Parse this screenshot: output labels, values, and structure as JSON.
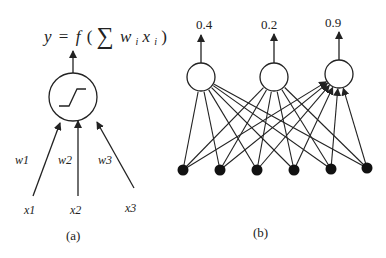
{
  "panel_a": {
    "formula": {
      "y": "y",
      "eq": "=",
      "f": "f",
      "open": "(",
      "sum": "∑",
      "w": "w",
      "wi_sub": "i",
      "x": "x",
      "xi_sub": "i",
      "close": ")"
    },
    "neuron": {
      "cx": 73,
      "cy": 97,
      "r": 24,
      "activation_icon": "step-sigmoid-icon"
    },
    "output_arrow": {
      "x": 73,
      "y1": 73,
      "y2": 51
    },
    "inputs": [
      {
        "label": "x1",
        "weight": "w1",
        "from": [
          33,
          196
        ],
        "to": [
          60,
          123
        ],
        "label_pos": [
          24,
          214
        ],
        "weight_pos": [
          15,
          164
        ]
      },
      {
        "label": "x2",
        "weight": "w2",
        "from": [
          78,
          196
        ],
        "to": [
          78,
          121
        ],
        "label_pos": [
          70,
          214
        ],
        "weight_pos": [
          58,
          164
        ]
      },
      {
        "label": "x3",
        "weight": "w3",
        "from": [
          134,
          188
        ],
        "to": [
          97,
          122
        ],
        "label_pos": [
          125,
          212
        ],
        "weight_pos": [
          98,
          164
        ]
      }
    ],
    "caption": "(a)"
  },
  "panel_b": {
    "outputs": [
      {
        "label": "0.4",
        "cx": 201,
        "cy": 77,
        "r": 14,
        "label_x": 196,
        "label_y": 29,
        "arrow_top": 35
      },
      {
        "label": "0.2",
        "cx": 274,
        "cy": 77,
        "r": 14,
        "label_x": 261,
        "label_y": 29,
        "arrow_top": 34
      },
      {
        "label": "0.9",
        "cx": 339,
        "cy": 74,
        "r": 14,
        "label_x": 325,
        "label_y": 27,
        "arrow_top": 32
      }
    ],
    "inputs": [
      {
        "cx": 183,
        "cy": 170
      },
      {
        "cx": 220,
        "cy": 170
      },
      {
        "cx": 257,
        "cy": 170
      },
      {
        "cx": 294,
        "cy": 170
      },
      {
        "cx": 331,
        "cy": 169
      },
      {
        "cx": 367,
        "cy": 168
      }
    ],
    "caption": "(b)"
  },
  "colors": {
    "stroke": "#222222",
    "node_fill": "#111111",
    "background": "#ffffff"
  }
}
